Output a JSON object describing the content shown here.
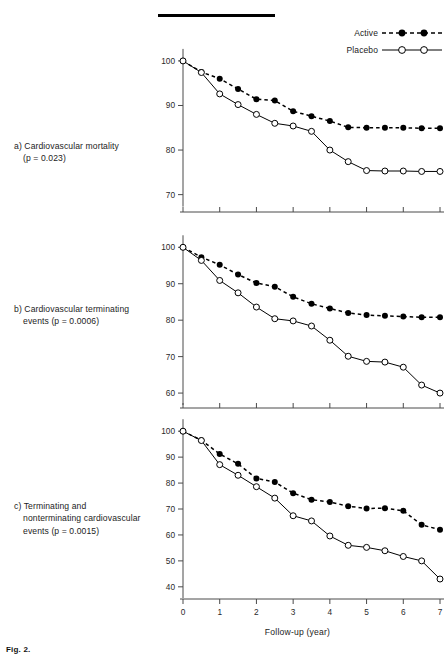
{
  "figure": {
    "top_rule": "horizontal-rule",
    "footer_label": "Fig. 2."
  },
  "legend": {
    "position": "top-right",
    "entries": [
      {
        "label": "Active",
        "marker": "filled-circle",
        "line": "dashed",
        "color": "#000000"
      },
      {
        "label": "Placebo",
        "marker": "open-circle",
        "line": "solid",
        "color": "#000000"
      }
    ]
  },
  "axis": {
    "xlabel": "Follow-up (year)",
    "xticks": [
      "0",
      "1",
      "2",
      "3",
      "4",
      "5",
      "6",
      "7"
    ],
    "xlim": [
      0,
      7
    ]
  },
  "captions": {
    "a": {
      "lead": "a) Cardiovascular mortality",
      "second": "(p = 0.023)"
    },
    "b": {
      "lead": "b) Cardiovascular terminating",
      "second": "events (p = 0.0006)"
    },
    "c": {
      "lead": "c) Terminating and",
      "second": "nonterminating cardiovascular",
      "third": "events (p = 0.0015)"
    }
  },
  "chart_data": [
    {
      "type": "line",
      "id": "a",
      "title": "a) Cardiovascular mortality (p = 0.023)",
      "xlabel": "Follow-up (year)",
      "ylabel": "",
      "xlim": [
        0,
        7
      ],
      "ylim": [
        67,
        102
      ],
      "yticks": [
        70,
        80,
        90,
        100
      ],
      "xticks": [
        0,
        1,
        2,
        3,
        4,
        5,
        6,
        7
      ],
      "grid": false,
      "legend_position": "top-right",
      "series": [
        {
          "name": "Active",
          "marker": "filled-circle",
          "line": "dashed",
          "x": [
            0,
            0.5,
            1,
            1.5,
            2,
            2.5,
            3,
            3.5,
            4,
            4.5,
            5,
            5.5,
            6,
            6.5,
            7
          ],
          "values": [
            100,
            97.5,
            96,
            93.7,
            91.4,
            91.1,
            88.7,
            87.6,
            86.5,
            85.1,
            85,
            85,
            85,
            84.9,
            84.9
          ]
        },
        {
          "name": "Placebo",
          "marker": "open-circle",
          "line": "solid",
          "x": [
            0,
            0.5,
            1,
            1.5,
            2,
            2.5,
            3,
            3.5,
            4,
            4.5,
            5,
            5.5,
            6,
            6.5,
            7
          ],
          "values": [
            100,
            97.4,
            92.6,
            90.2,
            88,
            86,
            85.4,
            84.2,
            80,
            77.4,
            75.4,
            75.3,
            75.3,
            75.2,
            75.2
          ]
        }
      ]
    },
    {
      "type": "line",
      "id": "b",
      "title": "b) Cardiovascular terminating events (p = 0.0006)",
      "xlabel": "Follow-up (year)",
      "ylabel": "",
      "xlim": [
        0,
        7
      ],
      "ylim": [
        57,
        102
      ],
      "yticks": [
        60,
        70,
        80,
        90,
        100
      ],
      "xticks": [
        0,
        1,
        2,
        3,
        4,
        5,
        6,
        7
      ],
      "grid": false,
      "legend_position": "top-right",
      "series": [
        {
          "name": "Active",
          "marker": "filled-circle",
          "line": "dashed",
          "x": [
            0,
            0.5,
            1,
            1.5,
            2,
            2.5,
            3,
            3.5,
            4,
            4.5,
            5,
            5.5,
            6,
            6.5,
            7
          ],
          "values": [
            100,
            97.3,
            95.2,
            92.5,
            90.2,
            89.2,
            86.4,
            84.5,
            83.2,
            82,
            81.4,
            81.2,
            81,
            80.8,
            80.8
          ]
        },
        {
          "name": "Placebo",
          "marker": "open-circle",
          "line": "solid",
          "x": [
            0,
            0.5,
            1,
            1.5,
            2,
            2.5,
            3,
            3.5,
            4,
            4.5,
            5,
            5.5,
            6,
            6.5,
            7
          ],
          "values": [
            100,
            96.4,
            90.9,
            87.5,
            83.6,
            80.4,
            79.8,
            78.4,
            74.5,
            70.1,
            68.7,
            68.5,
            67.1,
            62.2,
            60
          ]
        }
      ]
    },
    {
      "type": "line",
      "id": "c",
      "title": "c) Terminating and nonterminating cardiovascular events (p = 0.0015)",
      "xlabel": "Follow-up (year)",
      "ylabel": "",
      "xlim": [
        0,
        7
      ],
      "ylim": [
        38,
        102
      ],
      "yticks": [
        40,
        50,
        60,
        70,
        80,
        90,
        100
      ],
      "xticks": [
        0,
        1,
        2,
        3,
        4,
        5,
        6,
        7
      ],
      "grid": false,
      "legend_position": "top-right",
      "series": [
        {
          "name": "Active",
          "marker": "filled-circle",
          "line": "dashed",
          "x": [
            0,
            0.5,
            1,
            1.5,
            2,
            2.5,
            3,
            3.5,
            4,
            4.5,
            5,
            5.5,
            6,
            6.5,
            7
          ],
          "values": [
            100,
            96.5,
            91.2,
            87.4,
            81.8,
            80.4,
            76.1,
            73.6,
            72.7,
            71.1,
            70.2,
            70.3,
            69.3,
            63.9,
            62
          ]
        },
        {
          "name": "Placebo",
          "marker": "open-circle",
          "line": "solid",
          "x": [
            0,
            0.5,
            1,
            1.5,
            2,
            2.5,
            3,
            3.5,
            4,
            4.5,
            5,
            5.5,
            6,
            6.5,
            7
          ],
          "values": [
            100,
            96.4,
            87.1,
            83,
            78.6,
            74.2,
            67.4,
            65.4,
            59.6,
            56,
            55.2,
            53.9,
            51.7,
            50,
            43
          ]
        }
      ]
    }
  ]
}
